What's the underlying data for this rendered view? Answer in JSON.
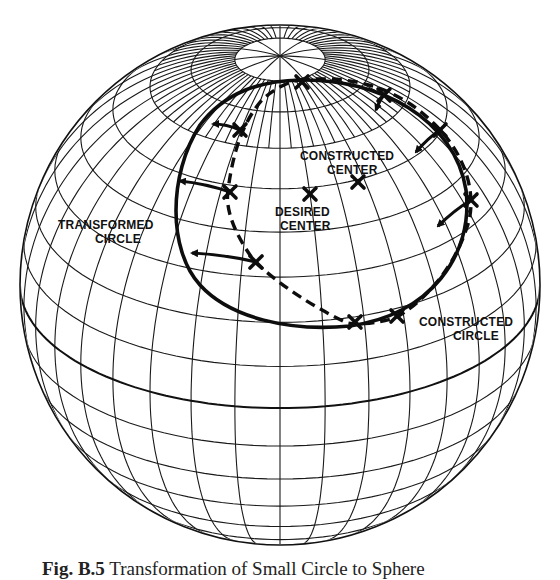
{
  "figure": {
    "caption_prefix": "Fig. B.5",
    "caption_text": "Transformation of Small Circle to Sphere",
    "caption_note": "caption partially cropped at bottom edge"
  },
  "labels": {
    "constructed_center": [
      "CONSTRUCTED",
      "CENTER"
    ],
    "desired_center": [
      "DESIRED",
      "CENTER"
    ],
    "transformed_circle": [
      "TRANSFORMED",
      "CIRCLE"
    ],
    "constructed_circle": [
      "CONSTRUCTED",
      "CIRCLE"
    ]
  },
  "geometry": {
    "sphere": {
      "cx": 280,
      "cy": 285,
      "r": 260
    },
    "north_pole": {
      "x": 280,
      "y": 56
    },
    "colors": {
      "ink": "#111111",
      "paper": "#ffffff"
    },
    "desired_center": {
      "x": 310,
      "y": 194
    },
    "constructed_center": {
      "x": 358,
      "y": 182
    },
    "transformed_circle_path": "M300,80 C380,78 455,120 466,190 C474,255 430,315 350,326 C290,332 230,318 200,285 C168,250 168,175 200,125 C225,92 260,81 300,80 Z",
    "constructed_circle_path": "M300,80 C340,76 395,80 440,130 C468,160 478,200 466,230 C452,272 420,305 395,318 C370,325 350,325 345,322 C310,305 280,285 255,262 C235,235 225,210 228,190 C232,160 240,125 262,100 C275,88 290,81 300,80 Z",
    "x_marks": [
      {
        "x": 302,
        "y": 82
      },
      {
        "x": 384,
        "y": 95
      },
      {
        "x": 440,
        "y": 130
      },
      {
        "x": 471,
        "y": 200
      },
      {
        "x": 397,
        "y": 316
      },
      {
        "x": 355,
        "y": 322
      },
      {
        "x": 256,
        "y": 262
      },
      {
        "x": 230,
        "y": 192
      },
      {
        "x": 240,
        "y": 130
      },
      {
        "x": 310,
        "y": 194
      },
      {
        "x": 358,
        "y": 182
      }
    ],
    "arrows": [
      {
        "from": [
          240,
          130
        ],
        "to": [
          213,
          124
        ]
      },
      {
        "from": [
          230,
          192
        ],
        "to": [
          180,
          181
        ]
      },
      {
        "from": [
          256,
          262
        ],
        "to": [
          192,
          253
        ]
      },
      {
        "from": [
          440,
          130
        ],
        "to": [
          416,
          152
        ]
      },
      {
        "from": [
          471,
          200
        ],
        "to": [
          438,
          226
        ]
      },
      {
        "from": [
          384,
          95
        ],
        "to": [
          376,
          110
        ]
      }
    ]
  }
}
